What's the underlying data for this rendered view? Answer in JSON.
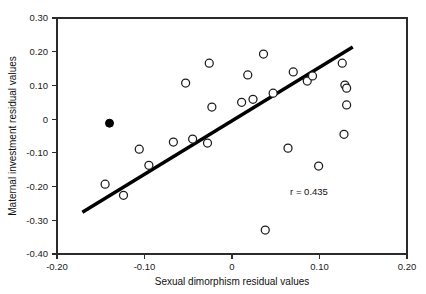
{
  "chart_data": {
    "type": "scatter",
    "title": "",
    "xlabel": "Sexual dimorphism residual values",
    "ylabel": "Maternal investment residual values",
    "xlim": [
      -0.2,
      0.2
    ],
    "ylim": [
      -0.4,
      0.3
    ],
    "xticks": [
      -0.2,
      -0.1,
      0,
      0.1,
      0.2
    ],
    "xticklabels": [
      "-0.20",
      "-0.10",
      "0",
      "0.10",
      "0.20"
    ],
    "yticks": [
      0.3,
      0.2,
      0.1,
      0,
      -0.1,
      -0.2,
      -0.3,
      -0.4
    ],
    "yticklabels": [
      "0.30",
      "0.20",
      "0.10",
      "0",
      "-0.10",
      "-0.20",
      "-0.30",
      "-0.40"
    ],
    "grid": false,
    "legend": "none",
    "annotations": [
      {
        "text": "r = 0.435",
        "x": 0.088,
        "y": -0.225
      }
    ],
    "annotation_label": "r=0.435",
    "series": [
      {
        "name": "open-points",
        "marker": "open-circle",
        "marker_color": "#1c1c1c",
        "points": [
          {
            "x": -0.145,
            "y": -0.193
          },
          {
            "x": -0.124,
            "y": -0.226
          },
          {
            "x": -0.106,
            "y": -0.089
          },
          {
            "x": -0.095,
            "y": -0.137
          },
          {
            "x": -0.067,
            "y": -0.068
          },
          {
            "x": -0.053,
            "y": 0.107
          },
          {
            "x": -0.045,
            "y": -0.059
          },
          {
            "x": -0.028,
            "y": -0.071
          },
          {
            "x": -0.026,
            "y": 0.166
          },
          {
            "x": -0.023,
            "y": 0.036
          },
          {
            "x": 0.011,
            "y": 0.05
          },
          {
            "x": 0.018,
            "y": 0.131
          },
          {
            "x": 0.024,
            "y": 0.059
          },
          {
            "x": 0.036,
            "y": 0.193
          },
          {
            "x": 0.038,
            "y": -0.329
          },
          {
            "x": 0.047,
            "y": 0.077
          },
          {
            "x": 0.064,
            "y": -0.086
          },
          {
            "x": 0.07,
            "y": 0.14
          },
          {
            "x": 0.086,
            "y": 0.113
          },
          {
            "x": 0.092,
            "y": 0.128
          },
          {
            "x": 0.099,
            "y": -0.139
          },
          {
            "x": 0.126,
            "y": 0.166
          },
          {
            "x": 0.129,
            "y": 0.101
          },
          {
            "x": 0.131,
            "y": 0.092
          },
          {
            "x": 0.131,
            "y": 0.042
          },
          {
            "x": 0.128,
            "y": -0.045
          }
        ]
      },
      {
        "name": "filled-point",
        "marker": "filled-circle",
        "marker_color": "#000000",
        "points": [
          {
            "x": -0.14,
            "y": -0.012
          }
        ]
      }
    ],
    "fit_line": {
      "name": "regression-line",
      "color": "#000000",
      "x_start": -0.171,
      "y_start": -0.276,
      "x_end": 0.138,
      "y_end": 0.214,
      "r": 0.435
    }
  }
}
